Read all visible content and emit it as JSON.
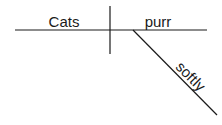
{
  "diagram": {
    "type": "sentence-diagram",
    "subject": "Cats",
    "verb": "purr",
    "modifiers": [
      {
        "word": "softly",
        "modifies": "purr",
        "role": "adverb"
      }
    ],
    "line_color": "#1a1a1a"
  }
}
